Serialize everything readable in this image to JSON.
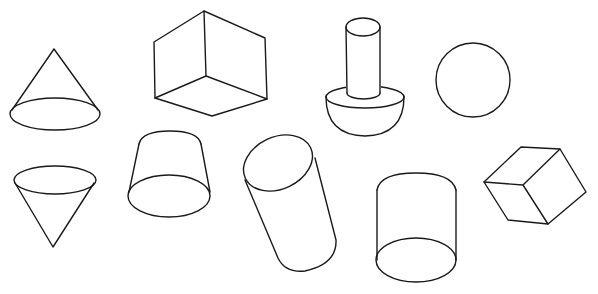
{
  "diagram": {
    "title": "",
    "stroke_color": "#1a1a1a",
    "background_color": "#ffffff",
    "shapes": [
      {
        "id": "cone-upright",
        "label": "cone (upright)"
      },
      {
        "id": "cube-large",
        "label": "cube"
      },
      {
        "id": "cylinder-on-hemisphere",
        "label": "cylinder on hemisphere"
      },
      {
        "id": "sphere",
        "label": "sphere"
      },
      {
        "id": "cone-inverted",
        "label": "cone (inverted)"
      },
      {
        "id": "frustum",
        "label": "truncated cone (frustum)"
      },
      {
        "id": "cylinder-tilted",
        "label": "tilted cylinder"
      },
      {
        "id": "cylinder-upright",
        "label": "cylinder"
      },
      {
        "id": "cube-small-tilted",
        "label": "tilted cube"
      }
    ]
  }
}
